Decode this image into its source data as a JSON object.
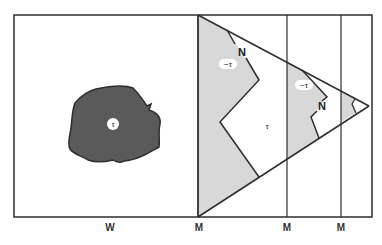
{
  "diagram": {
    "colors": {
      "stroke": "#2e2e2e",
      "blob_fill": "#5a5a5a",
      "shade_fill": "#d8d8d8",
      "background": "#ffffff"
    },
    "left_panel": {
      "blob_label": "τ"
    },
    "right_panel": {
      "region_labels": {
        "neg_tau_1": "−τ",
        "tau_center": "τ",
        "neg_tau_2": "−τ"
      },
      "node_labels": {
        "n1": "N",
        "n2": "N"
      }
    },
    "axis_labels": {
      "w": "W",
      "m1": "M",
      "m2": "M",
      "m3": "M"
    }
  }
}
